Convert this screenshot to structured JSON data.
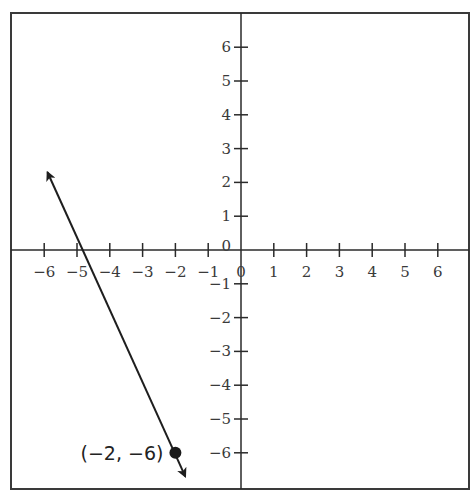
{
  "chart_data": {
    "type": "line",
    "title": "",
    "xlabel": "",
    "ylabel": "",
    "xlim": [
      -7,
      7
    ],
    "ylim": [
      -7,
      7
    ],
    "grid": false,
    "legend": null,
    "x_ticks": [
      -6,
      -5,
      -4,
      -3,
      -2,
      -1,
      0,
      1,
      2,
      3,
      4,
      5,
      6
    ],
    "y_ticks": [
      -6,
      -5,
      -4,
      -3,
      -2,
      -1,
      0,
      1,
      2,
      3,
      4,
      5,
      6
    ],
    "x_tick_labels": [
      "−6",
      "−5",
      "−4",
      "−3",
      "−2",
      "−1",
      "0",
      "1",
      "2",
      "3",
      "4",
      "5",
      "6"
    ],
    "y_tick_labels": [
      "−6",
      "−5",
      "−4",
      "−3",
      "−2",
      "−1",
      "0",
      "1",
      "2",
      "3",
      "4",
      "5",
      "6"
    ],
    "series": [
      {
        "name": "line",
        "type": "line-with-arrows",
        "x": [
          -5.9,
          -1.7
        ],
        "y": [
          2.3,
          -6.7
        ],
        "description": "Line through (-2, -6) with slope approximately -2.5, crossing x-axis near x = -4.8"
      }
    ],
    "points": [
      {
        "x": -2,
        "y": -6,
        "label": "(−2, −6)"
      }
    ],
    "annotations": [
      {
        "text": "(−2, −6)",
        "x": -2,
        "y": -6,
        "position": "left"
      }
    ]
  },
  "colors": {
    "frame": "#3a3a3a",
    "axis": "#2a2a2a",
    "line": "#1e1e1e",
    "text": "#3a3a3a",
    "background": "#ffffff"
  }
}
